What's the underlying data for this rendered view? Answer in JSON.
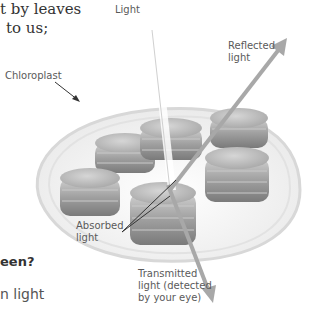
{
  "figure": {
    "colors": {
      "beam": "#a8a8a8",
      "granum": "#9a9a9a",
      "membrane": "#d8d8d8",
      "label_text": "#5a5a5a"
    },
    "labels": {
      "light": "Light",
      "reflected": [
        "Reflected",
        "light"
      ],
      "chloroplast": "Chloroplast",
      "absorbed": [
        "Absorbed",
        "light"
      ],
      "transmitted": [
        "Transmitted",
        "light (detected",
        "by your eye)"
      ]
    }
  },
  "page_text": {
    "line1": "t by leaves",
    "line2": "to us;",
    "question": "een?",
    "fragment": "n light"
  }
}
